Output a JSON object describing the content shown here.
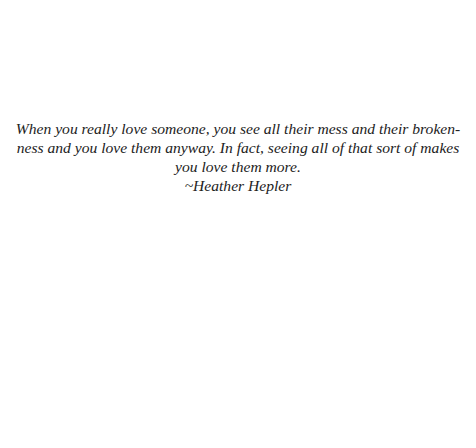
{
  "quote": {
    "lines": [
      "When you really love someone, you see all their mess and their broken-",
      "ness and you love them anyway. In fact, seeing all of that sort of makes",
      "you love them more."
    ],
    "attribution": "~Heather Hepler"
  },
  "colors": {
    "background": "#ffffff",
    "text": "#222222"
  }
}
